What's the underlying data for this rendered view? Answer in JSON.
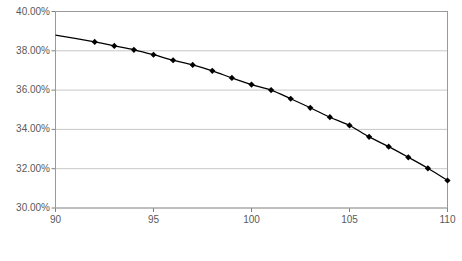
{
  "chart_data": {
    "type": "line",
    "title": "",
    "subtitle": "",
    "xlabel": "",
    "ylabel": "",
    "xlim": [
      90,
      110
    ],
    "ylim": [
      30,
      40
    ],
    "grid": true,
    "legend": null,
    "x_ticks": [
      "90",
      "95",
      "100",
      "105",
      "110"
    ],
    "x_tick_values": [
      90,
      95,
      100,
      105,
      110
    ],
    "y_ticks": [
      "30.00%",
      "32.00%",
      "34.00%",
      "36.00%",
      "38.00%",
      "40.00%"
    ],
    "y_tick_values": [
      30,
      32,
      34,
      36,
      38,
      40
    ],
    "marker": "diamond",
    "line_color": "#000000",
    "marker_color": "#000000",
    "grid_color": "#c8c8c8",
    "axis_color": "#808080",
    "tick_text_color": "#595959",
    "series": [
      {
        "name": "",
        "x": [
          90,
          92,
          93,
          94,
          95,
          96,
          97,
          98,
          99,
          100,
          101,
          102,
          103,
          104,
          105,
          106,
          107,
          108,
          109,
          110
        ],
        "values": [
          38.8,
          38.45,
          38.25,
          38.05,
          37.8,
          37.52,
          37.28,
          36.98,
          36.62,
          36.28,
          36.0,
          35.56,
          35.1,
          34.62,
          34.2,
          33.62,
          33.12,
          32.58,
          32.02,
          31.4
        ]
      }
    ],
    "marker_points": {
      "x": [
        92,
        93,
        94,
        95,
        96,
        97,
        98,
        99,
        100,
        101,
        102,
        103,
        104,
        105,
        106,
        107,
        108,
        109,
        110
      ],
      "values": [
        38.45,
        38.25,
        38.05,
        37.8,
        37.52,
        37.28,
        36.98,
        36.62,
        36.28,
        36.0,
        35.56,
        35.1,
        34.62,
        34.2,
        33.62,
        33.12,
        32.58,
        32.02,
        31.4
      ]
    },
    "annotations": []
  },
  "figure": {
    "caption": ""
  }
}
